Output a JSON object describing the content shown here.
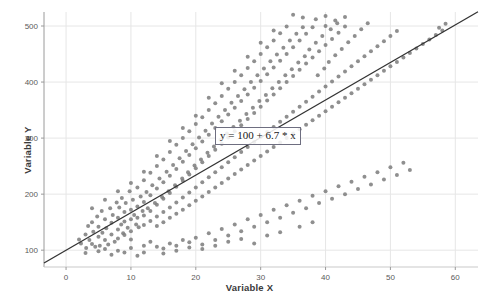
{
  "chart_data": {
    "type": "scatter",
    "title": "",
    "xlabel": "Variable X",
    "ylabel": "Variable Y",
    "xlim": [
      -3.4,
      63.5
    ],
    "ylim": [
      70,
      525
    ],
    "xticks": [
      0,
      10,
      20,
      30,
      40,
      50,
      60
    ],
    "yticks": [
      100,
      200,
      300,
      400,
      500
    ],
    "xtick_labels": [
      "0",
      "10",
      "20",
      "30",
      "40",
      "50",
      "60"
    ],
    "ytick_labels": [
      "100",
      "200",
      "300",
      "400",
      "500"
    ],
    "grid": true,
    "legend": "none",
    "annotation": "y = 100 + 6.7 * x",
    "marker_color": "#808080",
    "marker_size": 3.1,
    "trendline": {
      "type": "line",
      "equation": "y = 100 + 6.7 * x",
      "intercept": 100,
      "slope": 6.7,
      "color": "#333333",
      "x_start": -3.4,
      "x_end": 63.5
    },
    "points": [
      [
        2.0,
        119
      ],
      [
        2.3,
        112
      ],
      [
        3.0,
        128
      ],
      [
        3.1,
        104
      ],
      [
        3.4,
        143
      ],
      [
        3.6,
        118
      ],
      [
        4.0,
        150
      ],
      [
        4.0,
        111
      ],
      [
        4.2,
        133
      ],
      [
        4.5,
        106
      ],
      [
        4.8,
        160
      ],
      [
        5.0,
        124
      ],
      [
        5.0,
        142
      ],
      [
        5.2,
        108
      ],
      [
        5.5,
        170
      ],
      [
        5.6,
        131
      ],
      [
        6.0,
        155
      ],
      [
        6.0,
        118
      ],
      [
        6.2,
        139
      ],
      [
        6.5,
        110
      ],
      [
        6.8,
        175
      ],
      [
        7.0,
        149
      ],
      [
        7.0,
        128
      ],
      [
        7.2,
        163
      ],
      [
        7.5,
        115
      ],
      [
        7.8,
        185
      ],
      [
        8.0,
        158
      ],
      [
        8.0,
        137
      ],
      [
        8.0,
        121
      ],
      [
        8.2,
        176
      ],
      [
        8.5,
        146
      ],
      [
        8.6,
        193
      ],
      [
        8.8,
        130
      ],
      [
        9.0,
        168
      ],
      [
        9.0,
        151
      ],
      [
        9.0,
        127
      ],
      [
        9.2,
        184
      ],
      [
        9.5,
        140
      ],
      [
        9.8,
        205
      ],
      [
        10.0,
        172
      ],
      [
        10.0,
        155
      ],
      [
        10.0,
        134
      ],
      [
        10.0,
        119
      ],
      [
        10.3,
        190
      ],
      [
        10.5,
        163
      ],
      [
        10.8,
        146
      ],
      [
        11.0,
        212
      ],
      [
        11.0,
        178
      ],
      [
        11.0,
        158
      ],
      [
        11.2,
        141
      ],
      [
        11.5,
        196
      ],
      [
        11.8,
        170
      ],
      [
        12.0,
        225
      ],
      [
        12.0,
        186
      ],
      [
        12.0,
        162
      ],
      [
        12.0,
        145
      ],
      [
        12.4,
        204
      ],
      [
        12.6,
        175
      ],
      [
        13.0,
        238
      ],
      [
        13.0,
        198
      ],
      [
        13.0,
        170
      ],
      [
        13.0,
        152
      ],
      [
        13.3,
        216
      ],
      [
        13.7,
        184
      ],
      [
        14.0,
        250
      ],
      [
        14.0,
        210
      ],
      [
        14.0,
        181
      ],
      [
        14.0,
        160
      ],
      [
        14.0,
        143
      ],
      [
        14.4,
        228
      ],
      [
        14.8,
        195
      ],
      [
        15.0,
        262
      ],
      [
        15.0,
        221
      ],
      [
        15.0,
        192
      ],
      [
        15.0,
        168
      ],
      [
        15.0,
        150
      ],
      [
        15.5,
        240
      ],
      [
        15.8,
        205
      ],
      [
        16.0,
        275
      ],
      [
        16.0,
        233
      ],
      [
        16.0,
        202
      ],
      [
        16.0,
        176
      ],
      [
        16.0,
        158
      ],
      [
        16.5,
        252
      ],
      [
        16.8,
        216
      ],
      [
        17.0,
        288
      ],
      [
        17.0,
        245
      ],
      [
        17.0,
        213
      ],
      [
        17.0,
        185
      ],
      [
        17.0,
        165
      ],
      [
        17.5,
        264
      ],
      [
        17.9,
        228
      ],
      [
        18.0,
        300
      ],
      [
        18.0,
        258
      ],
      [
        18.0,
        224
      ],
      [
        18.0,
        194
      ],
      [
        18.0,
        172
      ],
      [
        18.5,
        277
      ],
      [
        18.8,
        239
      ],
      [
        19.0,
        312
      ],
      [
        19.0,
        270
      ],
      [
        19.0,
        235
      ],
      [
        19.0,
        203
      ],
      [
        19.0,
        180
      ],
      [
        19.5,
        289
      ],
      [
        19.8,
        251
      ],
      [
        20.0,
        325
      ],
      [
        20.0,
        282
      ],
      [
        20.0,
        246
      ],
      [
        20.0,
        212
      ],
      [
        20.0,
        188
      ],
      [
        20.5,
        301
      ],
      [
        20.8,
        262
      ],
      [
        21.0,
        337
      ],
      [
        21.0,
        294
      ],
      [
        21.0,
        257
      ],
      [
        21.0,
        221
      ],
      [
        21.0,
        196
      ],
      [
        21.5,
        313
      ],
      [
        21.8,
        274
      ],
      [
        22.0,
        350
      ],
      [
        22.0,
        306
      ],
      [
        22.0,
        268
      ],
      [
        22.0,
        230
      ],
      [
        22.0,
        204
      ],
      [
        22.5,
        326
      ],
      [
        22.8,
        285
      ],
      [
        23.0,
        362
      ],
      [
        23.0,
        318
      ],
      [
        23.0,
        279
      ],
      [
        23.0,
        239
      ],
      [
        23.0,
        212
      ],
      [
        23.5,
        338
      ],
      [
        23.8,
        297
      ],
      [
        24.0,
        375
      ],
      [
        24.0,
        330
      ],
      [
        24.0,
        290
      ],
      [
        24.0,
        248
      ],
      [
        24.0,
        220
      ],
      [
        24.5,
        350
      ],
      [
        24.8,
        308
      ],
      [
        25.0,
        388
      ],
      [
        25.0,
        342
      ],
      [
        25.0,
        301
      ],
      [
        25.0,
        257
      ],
      [
        25.0,
        228
      ],
      [
        25.5,
        363
      ],
      [
        25.8,
        320
      ],
      [
        26.0,
        400
      ],
      [
        26.0,
        354
      ],
      [
        26.0,
        312
      ],
      [
        26.0,
        266
      ],
      [
        26.0,
        236
      ],
      [
        26.5,
        375
      ],
      [
        26.8,
        331
      ],
      [
        27.0,
        412
      ],
      [
        27.0,
        366
      ],
      [
        27.0,
        323
      ],
      [
        27.0,
        275
      ],
      [
        27.0,
        244
      ],
      [
        27.5,
        387
      ],
      [
        27.8,
        343
      ],
      [
        28.0,
        425
      ],
      [
        28.0,
        378
      ],
      [
        28.0,
        334
      ],
      [
        28.0,
        284
      ],
      [
        28.0,
        252
      ],
      [
        28.5,
        400
      ],
      [
        28.8,
        354
      ],
      [
        29.0,
        437
      ],
      [
        29.0,
        390
      ],
      [
        29.0,
        345
      ],
      [
        29.0,
        293
      ],
      [
        29.0,
        260
      ],
      [
        29.5,
        412
      ],
      [
        29.8,
        366
      ],
      [
        30.0,
        450
      ],
      [
        30.0,
        402
      ],
      [
        30.0,
        356
      ],
      [
        30.0,
        302
      ],
      [
        30.0,
        268
      ],
      [
        30.5,
        424
      ],
      [
        30.8,
        377
      ],
      [
        31.0,
        462
      ],
      [
        31.0,
        414
      ],
      [
        31.0,
        367
      ],
      [
        31.0,
        311
      ],
      [
        31.0,
        276
      ],
      [
        31.5,
        437
      ],
      [
        31.8,
        389
      ],
      [
        32.0,
        474
      ],
      [
        32.0,
        426
      ],
      [
        32.0,
        378
      ],
      [
        32.0,
        320
      ],
      [
        32.0,
        284
      ],
      [
        32.5,
        449
      ],
      [
        32.8,
        400
      ],
      [
        33.0,
        487
      ],
      [
        33.0,
        438
      ],
      [
        33.0,
        389
      ],
      [
        33.0,
        329
      ],
      [
        33.0,
        292
      ],
      [
        33.5,
        461
      ],
      [
        33.8,
        412
      ],
      [
        34.0,
        499
      ],
      [
        34.0,
        450
      ],
      [
        34.0,
        400
      ],
      [
        34.0,
        338
      ],
      [
        34.0,
        300
      ],
      [
        34.5,
        474
      ],
      [
        34.8,
        423
      ],
      [
        35.0,
        462
      ],
      [
        35.0,
        411
      ],
      [
        35.0,
        347
      ],
      [
        35.0,
        308
      ],
      [
        35.5,
        486
      ],
      [
        35.8,
        435
      ],
      [
        36.0,
        474
      ],
      [
        36.0,
        422
      ],
      [
        36.0,
        356
      ],
      [
        36.0,
        316
      ],
      [
        36.5,
        498
      ],
      [
        36.8,
        446
      ],
      [
        37.0,
        486
      ],
      [
        37.0,
        433
      ],
      [
        37.0,
        365
      ],
      [
        37.0,
        324
      ],
      [
        37.5,
        458
      ],
      [
        38.0,
        498
      ],
      [
        38.0,
        444
      ],
      [
        38.0,
        374
      ],
      [
        38.0,
        332
      ],
      [
        38.5,
        470
      ],
      [
        38.8,
        412
      ],
      [
        39.0,
        455
      ],
      [
        39.0,
        383
      ],
      [
        39.0,
        340
      ],
      [
        39.5,
        482
      ],
      [
        39.8,
        424
      ],
      [
        40.0,
        500
      ],
      [
        40.0,
        466
      ],
      [
        40.0,
        392
      ],
      [
        40.0,
        348
      ],
      [
        40.5,
        436
      ],
      [
        40.8,
        494
      ],
      [
        41.0,
        477
      ],
      [
        41.0,
        401
      ],
      [
        41.0,
        356
      ],
      [
        41.5,
        448
      ],
      [
        41.8,
        505
      ],
      [
        42.0,
        488
      ],
      [
        42.0,
        410
      ],
      [
        42.0,
        364
      ],
      [
        42.5,
        459
      ],
      [
        43.0,
        499
      ],
      [
        43.0,
        419
      ],
      [
        43.0,
        372
      ],
      [
        43.5,
        471
      ],
      [
        44.0,
        428
      ],
      [
        44.0,
        380
      ],
      [
        44.5,
        482
      ],
      [
        45.0,
        437
      ],
      [
        45.0,
        388
      ],
      [
        45.5,
        494
      ],
      [
        46.0,
        446
      ],
      [
        46.0,
        396
      ],
      [
        46.5,
        505
      ],
      [
        47.0,
        455
      ],
      [
        47.0,
        404
      ],
      [
        48.0,
        464
      ],
      [
        48.0,
        412
      ],
      [
        49.0,
        473
      ],
      [
        49.0,
        420
      ],
      [
        50.0,
        482
      ],
      [
        50.0,
        428
      ],
      [
        51.0,
        436
      ],
      [
        51.0,
        491
      ],
      [
        52.0,
        444
      ],
      [
        53.0,
        452
      ],
      [
        54.0,
        460
      ],
      [
        55.0,
        468
      ],
      [
        56.0,
        476
      ],
      [
        57.0,
        484
      ],
      [
        57.5,
        497
      ],
      [
        58.0,
        492
      ],
      [
        58.5,
        504
      ],
      [
        12.0,
        108
      ],
      [
        13.0,
        115
      ],
      [
        14.0,
        106
      ],
      [
        16.0,
        112
      ],
      [
        18.0,
        118
      ],
      [
        19.0,
        105
      ],
      [
        20.0,
        122
      ],
      [
        21.0,
        110
      ],
      [
        22.0,
        130
      ],
      [
        23.0,
        118
      ],
      [
        24.0,
        138
      ],
      [
        25.0,
        126
      ],
      [
        26.0,
        146
      ],
      [
        27.0,
        134
      ],
      [
        28.0,
        155
      ],
      [
        29.0,
        142
      ],
      [
        30.0,
        163
      ],
      [
        31.0,
        150
      ],
      [
        32.0,
        172
      ],
      [
        33.0,
        158
      ],
      [
        34.0,
        180
      ],
      [
        35.0,
        167
      ],
      [
        36.0,
        188
      ],
      [
        37.0,
        175
      ],
      [
        38.0,
        197
      ],
      [
        39.0,
        184
      ],
      [
        40.0,
        205
      ],
      [
        41.0,
        192
      ],
      [
        42.0,
        214
      ],
      [
        43.0,
        200
      ],
      [
        44.0,
        222
      ],
      [
        45.0,
        209
      ],
      [
        46.0,
        231
      ],
      [
        47.0,
        217
      ],
      [
        48.0,
        239
      ],
      [
        49.0,
        226
      ],
      [
        50.0,
        248
      ],
      [
        51.0,
        234
      ],
      [
        52.0,
        256
      ],
      [
        53.0,
        243
      ],
      [
        35.0,
        520
      ],
      [
        36.5,
        515
      ],
      [
        38.5,
        512
      ],
      [
        40.0,
        518
      ],
      [
        41.5,
        510
      ],
      [
        43.0,
        516
      ],
      [
        3.0,
        95
      ],
      [
        5.0,
        98
      ],
      [
        7.0,
        92
      ],
      [
        9.0,
        96
      ],
      [
        11.0,
        90
      ],
      [
        15.0,
        94
      ],
      [
        17.0,
        99
      ],
      [
        4.0,
        175
      ],
      [
        6.0,
        190
      ],
      [
        8.0,
        205
      ],
      [
        10.0,
        220
      ],
      [
        12.0,
        240
      ],
      [
        14.0,
        268
      ],
      [
        16.0,
        295
      ],
      [
        18.0,
        318
      ],
      [
        20.0,
        340
      ],
      [
        22.0,
        372
      ],
      [
        24.0,
        398
      ],
      [
        26.0,
        420
      ],
      [
        28.0,
        445
      ],
      [
        30.0,
        470
      ],
      [
        32.0,
        492
      ],
      [
        6.0,
        102
      ],
      [
        8.0,
        99
      ],
      [
        10.0,
        104
      ],
      [
        12.0,
        96
      ],
      [
        15.0,
        103
      ],
      [
        17.0,
        108
      ],
      [
        19.0,
        114
      ],
      [
        21.0,
        102
      ],
      [
        23.0,
        108
      ],
      [
        25.0,
        115
      ],
      [
        27.0,
        120
      ],
      [
        29.0,
        112
      ],
      [
        31.0,
        126
      ],
      [
        33.0,
        132
      ],
      [
        36.0,
        142
      ],
      [
        38.0,
        150
      ]
    ]
  }
}
